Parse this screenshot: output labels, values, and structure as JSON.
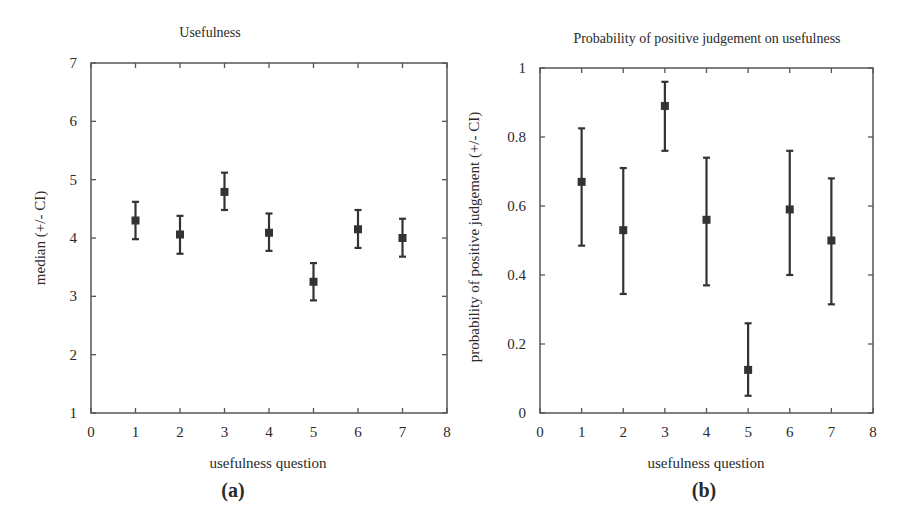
{
  "figure": {
    "panels": [
      {
        "id": "a",
        "label": "(a)"
      },
      {
        "id": "b",
        "label": "(b)"
      }
    ]
  },
  "chart_data": [
    {
      "type": "scatter",
      "subtype": "errorbar",
      "title": "Usefulness",
      "xlabel": "usefulness question",
      "ylabel": "median (+/- CI)",
      "panel_label": "(a)",
      "xlim": [
        0,
        8
      ],
      "ylim": [
        1,
        7
      ],
      "xticks": [
        0,
        1,
        2,
        3,
        4,
        5,
        6,
        7,
        8
      ],
      "xtick_labels": [
        "0",
        "1",
        "2",
        "3",
        "4",
        "5",
        "6",
        "7",
        "8"
      ],
      "yticks": [
        1,
        2,
        3,
        4,
        5,
        6,
        7
      ],
      "ytick_labels": [
        "1",
        "2",
        "3",
        "4",
        "5",
        "6",
        "7"
      ],
      "grid": false,
      "legend": null,
      "marker": "square",
      "color": "#333333",
      "x": [
        1,
        2,
        3,
        4,
        5,
        6,
        7
      ],
      "values": [
        4.3,
        4.06,
        4.79,
        4.09,
        3.25,
        4.15,
        4.0
      ],
      "ci_upper": [
        4.62,
        4.38,
        5.12,
        4.42,
        3.57,
        4.48,
        4.33
      ],
      "ci_lower": [
        3.98,
        3.73,
        4.48,
        3.78,
        2.93,
        3.83,
        3.68
      ]
    },
    {
      "type": "scatter",
      "subtype": "errorbar",
      "title": "Probability of positive judgement on usefulness",
      "xlabel": "usefulness question",
      "ylabel": "probability of positive judgement (+/- CI)",
      "panel_label": "(b)",
      "xlim": [
        0,
        8
      ],
      "ylim": [
        0,
        1
      ],
      "xticks": [
        0,
        1,
        2,
        3,
        4,
        5,
        6,
        7,
        8
      ],
      "xtick_labels": [
        "0",
        "1",
        "2",
        "3",
        "4",
        "5",
        "6",
        "7",
        "8"
      ],
      "yticks": [
        0,
        0.2,
        0.4,
        0.6,
        0.8,
        1
      ],
      "ytick_labels": [
        "0",
        "0.2",
        "0.4",
        "0.6",
        "0.8",
        "1"
      ],
      "grid": false,
      "legend": null,
      "marker": "square",
      "color": "#333333",
      "x": [
        1,
        2,
        3,
        4,
        5,
        6,
        7
      ],
      "values": [
        0.67,
        0.53,
        0.89,
        0.56,
        0.125,
        0.59,
        0.5
      ],
      "ci_upper": [
        0.825,
        0.71,
        0.96,
        0.74,
        0.26,
        0.76,
        0.68
      ],
      "ci_lower": [
        0.485,
        0.345,
        0.76,
        0.37,
        0.05,
        0.4,
        0.315
      ]
    }
  ]
}
